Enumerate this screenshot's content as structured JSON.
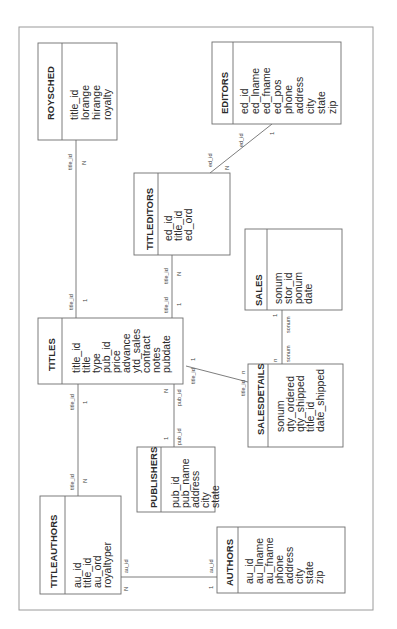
{
  "diagram": {
    "orientation": "rotated-90-ccw",
    "colors": {
      "line": "#6e6e6e",
      "text": "#2a2a2a",
      "border": "#9a9a9a",
      "background": "#ffffff"
    },
    "entities": [
      {
        "id": "roysched",
        "name": "ROYSCHED",
        "fields": [
          "title_id",
          "lorange",
          "hirange",
          "royalty"
        ]
      },
      {
        "id": "editors",
        "name": "EDITORS",
        "fields": [
          "ed_id",
          "ed_lname",
          "ed_fname",
          "ed_pos",
          "phone",
          "address",
          "city",
          "state",
          "zip"
        ]
      },
      {
        "id": "titleditors",
        "name": "TITLEDITORS",
        "fields": [
          "ed_id",
          "title_id",
          "ed_ord"
        ]
      },
      {
        "id": "titles",
        "name": "TITLES",
        "fields": [
          "title_id",
          "title",
          "type",
          "pub_id",
          "price",
          "advance",
          "ytd_sales",
          "contract",
          "notes",
          "pubdate"
        ]
      },
      {
        "id": "sales",
        "name": "SALES",
        "fields": [
          "sonum",
          "stor_id",
          "ponum",
          "date"
        ]
      },
      {
        "id": "salesdetails",
        "name": "SALESDETAILS",
        "fields": [
          "sonum",
          "qty_ordered",
          "qty_shipped",
          "title_id",
          "date_shipped"
        ]
      },
      {
        "id": "publishers",
        "name": "PUBLISHERS",
        "fields": [
          "pub_id",
          "pub_name",
          "address",
          "city",
          "state"
        ]
      },
      {
        "id": "titleauthors",
        "name": "TITLEAUTHORS",
        "fields": [
          "au_id",
          "title_id",
          "au_ord",
          "royaltyper"
        ]
      },
      {
        "id": "authors",
        "name": "AUTHORS",
        "fields": [
          "au_id",
          "au_lname",
          "au_fname",
          "phone",
          "address",
          "city",
          "state",
          "zip"
        ]
      }
    ],
    "relationships": [
      {
        "from": "titles",
        "to": "roysched",
        "from_key": "title_id",
        "to_key": "title_id",
        "from_card": "1",
        "to_card": "N"
      },
      {
        "from": "titles",
        "to": "titleditors",
        "from_key": "title_id",
        "to_key": "title_id",
        "from_card": "1",
        "to_card": "N"
      },
      {
        "from": "editors",
        "to": "titleditors",
        "from_key": "ed_id",
        "to_key": "ed_id",
        "from_card": "1",
        "to_card": "N"
      },
      {
        "from": "titles",
        "to": "titleauthors",
        "from_key": "title_id",
        "to_key": "title_id",
        "from_card": "1",
        "to_card": "N"
      },
      {
        "from": "publishers",
        "to": "titles",
        "from_key": "pub_id",
        "to_key": "pub_id",
        "from_card": "1",
        "to_card": "N"
      },
      {
        "from": "titles",
        "to": "salesdetails",
        "from_key": "title_id",
        "to_key": "title_id",
        "from_card": "1",
        "to_card": "n"
      },
      {
        "from": "sales",
        "to": "salesdetails",
        "from_key": "sonum",
        "to_key": "sonum",
        "from_card": "1",
        "to_card": "n"
      },
      {
        "from": "authors",
        "to": "titleauthors",
        "from_key": "au_id",
        "to_key": "au_id",
        "from_card": "1",
        "to_card": "N"
      }
    ],
    "labels": {
      "title_id": "title_id",
      "ed_id": "ed_id",
      "pub_id": "pub_id",
      "sonum": "sonum",
      "au_id": "au_id",
      "one": "1",
      "many_upper": "N",
      "many_lower": "n"
    }
  }
}
